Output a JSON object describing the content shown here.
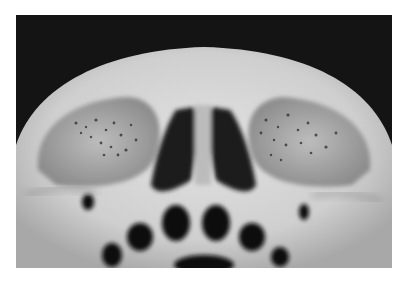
{
  "image": {
    "subject": "Human skull viewed from below/front showing orbits, nasal aperture and teeth sockets",
    "palette": {
      "background": "#141414",
      "bone": "#d2d2d2",
      "bone_shadow": "#9a9a9a",
      "cavity": "#0e0e0e"
    }
  }
}
